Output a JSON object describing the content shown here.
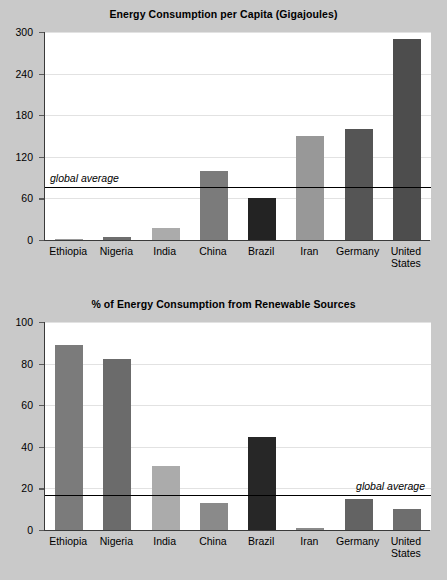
{
  "page": {
    "background_color": "#c9c9c9",
    "panel_background_color": "#ffffff"
  },
  "chart_data": [
    {
      "type": "bar",
      "title": "Energy Consumption per Capita (Gigajoules)",
      "xlabel": "",
      "ylabel": "",
      "ylim": [
        0,
        300
      ],
      "yticks": [
        0,
        60,
        120,
        180,
        240,
        300
      ],
      "ytick_labels": [
        "0",
        "60",
        "120",
        "180",
        "240",
        "300"
      ],
      "grid": true,
      "legend": "none",
      "categories": [
        "Ethiopia",
        "Nigeria",
        "India",
        "China",
        "Brazil",
        "Iran",
        "Germany",
        "United States"
      ],
      "values": [
        2,
        5,
        18,
        100,
        60,
        150,
        160,
        290
      ],
      "bar_colors": [
        "#9a9a9a",
        "#6e6e6e",
        "#ababab",
        "#7b7b7b",
        "#232323",
        "#989898",
        "#555555",
        "#4d4d4d"
      ],
      "annotations": [
        {
          "name": "global-average",
          "label": "global average",
          "value": 77,
          "line_color": "#000000",
          "label_position": "above-left"
        }
      ]
    },
    {
      "type": "bar",
      "title": "% of Energy Consumption from Renewable Sources",
      "xlabel": "",
      "ylabel": "",
      "ylim": [
        0,
        100
      ],
      "yticks": [
        0,
        20,
        40,
        60,
        80,
        100
      ],
      "ytick_labels": [
        "0",
        "20",
        "40",
        "60",
        "80",
        "100"
      ],
      "grid": true,
      "legend": "none",
      "categories": [
        "Ethiopia",
        "Nigeria",
        "India",
        "China",
        "Brazil",
        "Iran",
        "Germany",
        "United States"
      ],
      "values": [
        89,
        82,
        31,
        13,
        44.5,
        1,
        15,
        10
      ],
      "bar_colors": [
        "#7b7b7b",
        "#6b6b6b",
        "#ababab",
        "#8a8a8a",
        "#272727",
        "#8a8a8a",
        "#636363",
        "#6e6e6e"
      ],
      "annotations": [
        {
          "name": "global-average",
          "label": "global average",
          "value": 17,
          "line_color": "#000000",
          "label_position": "above-right"
        }
      ]
    }
  ]
}
